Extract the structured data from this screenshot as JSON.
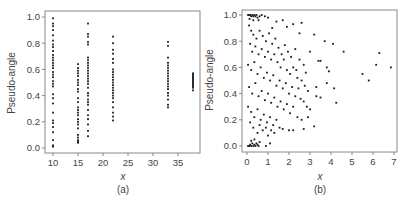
{
  "chart_data": [
    {
      "panel": "(a)",
      "type": "scatter",
      "xlabel": "x",
      "ylabel": "Pseudo-angle",
      "caption": "(a)",
      "xlim": [
        8.5,
        38.5
      ],
      "ylim": [
        -0.04,
        1.04
      ],
      "xticks": [
        10,
        15,
        20,
        25,
        30,
        35
      ],
      "yticks": [
        "0.0",
        "0.2",
        "0.4",
        "0.6",
        "0.8",
        "1.0"
      ],
      "grid": false,
      "columns": [
        {
          "x": 10,
          "y_min": 0.01,
          "y_max": 0.99
        },
        {
          "x": 15,
          "y_min": 0.04,
          "y_max": 0.64
        },
        {
          "x": 17,
          "y_min": 0.09,
          "y_max": 0.95
        },
        {
          "x": 22,
          "y_min": 0.21,
          "y_max": 0.85
        },
        {
          "x": 33,
          "y_min": 0.31,
          "y_max": 0.81
        },
        {
          "x": 38,
          "y_min": 0.44,
          "y_max": 0.57
        }
      ],
      "points": [
        [
          10,
          0.99
        ],
        [
          10,
          0.95
        ],
        [
          10,
          0.93
        ],
        [
          10,
          0.9
        ],
        [
          10,
          0.86
        ],
        [
          10,
          0.82
        ],
        [
          10,
          0.79
        ],
        [
          10,
          0.77
        ],
        [
          10,
          0.74
        ],
        [
          10,
          0.71
        ],
        [
          10,
          0.69
        ],
        [
          10,
          0.67
        ],
        [
          10,
          0.65
        ],
        [
          10,
          0.63
        ],
        [
          10,
          0.61
        ],
        [
          10,
          0.58
        ],
        [
          10,
          0.56
        ],
        [
          10,
          0.54
        ],
        [
          10,
          0.51
        ],
        [
          10,
          0.49
        ],
        [
          10,
          0.47
        ],
        [
          10,
          0.41
        ],
        [
          10,
          0.38
        ],
        [
          10,
          0.34
        ],
        [
          10,
          0.27
        ],
        [
          10,
          0.21
        ],
        [
          10,
          0.19
        ],
        [
          10,
          0.16
        ],
        [
          10,
          0.12
        ],
        [
          10,
          0.06
        ],
        [
          10,
          0.02
        ],
        [
          10,
          0.01
        ],
        [
          15,
          0.64
        ],
        [
          15,
          0.61
        ],
        [
          15,
          0.59
        ],
        [
          15,
          0.57
        ],
        [
          15,
          0.55
        ],
        [
          15,
          0.52
        ],
        [
          15,
          0.5
        ],
        [
          15,
          0.48
        ],
        [
          15,
          0.45
        ],
        [
          15,
          0.43
        ],
        [
          15,
          0.38
        ],
        [
          15,
          0.35
        ],
        [
          15,
          0.31
        ],
        [
          15,
          0.29
        ],
        [
          15,
          0.27
        ],
        [
          15,
          0.25
        ],
        [
          15,
          0.22
        ],
        [
          15,
          0.2
        ],
        [
          15,
          0.18
        ],
        [
          15,
          0.15
        ],
        [
          15,
          0.1
        ],
        [
          15,
          0.08
        ],
        [
          15,
          0.06
        ],
        [
          15,
          0.05
        ],
        [
          15,
          0.04
        ],
        [
          17,
          0.95
        ],
        [
          17,
          0.87
        ],
        [
          17,
          0.85
        ],
        [
          17,
          0.81
        ],
        [
          17,
          0.79
        ],
        [
          17,
          0.69
        ],
        [
          17,
          0.67
        ],
        [
          17,
          0.65
        ],
        [
          17,
          0.63
        ],
        [
          17,
          0.61
        ],
        [
          17,
          0.59
        ],
        [
          17,
          0.57
        ],
        [
          17,
          0.55
        ],
        [
          17,
          0.53
        ],
        [
          17,
          0.51
        ],
        [
          17,
          0.49
        ],
        [
          17,
          0.46
        ],
        [
          17,
          0.42
        ],
        [
          17,
          0.4
        ],
        [
          17,
          0.37
        ],
        [
          17,
          0.35
        ],
        [
          17,
          0.33
        ],
        [
          17,
          0.29
        ],
        [
          17,
          0.25
        ],
        [
          17,
          0.22
        ],
        [
          17,
          0.18
        ],
        [
          17,
          0.13
        ],
        [
          17,
          0.09
        ],
        [
          22,
          0.85
        ],
        [
          22,
          0.8
        ],
        [
          22,
          0.75
        ],
        [
          22,
          0.72
        ],
        [
          22,
          0.68
        ],
        [
          22,
          0.65
        ],
        [
          22,
          0.6
        ],
        [
          22,
          0.58
        ],
        [
          22,
          0.56
        ],
        [
          22,
          0.54
        ],
        [
          22,
          0.52
        ],
        [
          22,
          0.5
        ],
        [
          22,
          0.48
        ],
        [
          22,
          0.46
        ],
        [
          22,
          0.44
        ],
        [
          22,
          0.42
        ],
        [
          22,
          0.4
        ],
        [
          22,
          0.38
        ],
        [
          22,
          0.35
        ],
        [
          22,
          0.31
        ],
        [
          22,
          0.27
        ],
        [
          22,
          0.24
        ],
        [
          22,
          0.21
        ],
        [
          33,
          0.81
        ],
        [
          33,
          0.78
        ],
        [
          33,
          0.69
        ],
        [
          33,
          0.65
        ],
        [
          33,
          0.63
        ],
        [
          33,
          0.61
        ],
        [
          33,
          0.59
        ],
        [
          33,
          0.57
        ],
        [
          33,
          0.55
        ],
        [
          33,
          0.53
        ],
        [
          33,
          0.51
        ],
        [
          33,
          0.49
        ],
        [
          33,
          0.47
        ],
        [
          33,
          0.45
        ],
        [
          33,
          0.42
        ],
        [
          33,
          0.4
        ],
        [
          33,
          0.37
        ],
        [
          33,
          0.33
        ],
        [
          33,
          0.31
        ],
        [
          38,
          0.57
        ],
        [
          38,
          0.56
        ],
        [
          38,
          0.55
        ],
        [
          38,
          0.54
        ],
        [
          38,
          0.53
        ],
        [
          38,
          0.52
        ],
        [
          38,
          0.51
        ],
        [
          38,
          0.5
        ],
        [
          38,
          0.49
        ],
        [
          38,
          0.48
        ],
        [
          38,
          0.47
        ],
        [
          38,
          0.46
        ],
        [
          38,
          0.44
        ]
      ]
    },
    {
      "panel": "(b)",
      "type": "scatter",
      "xlabel": "x",
      "ylabel": "Pseudo-angle",
      "caption": "(b)",
      "xlim": [
        -0.25,
        7.15
      ],
      "ylim": [
        -0.04,
        1.04
      ],
      "xticks": [
        0,
        1,
        2,
        3,
        4,
        5,
        6,
        7
      ],
      "yticks": [
        "0.0",
        "0.2",
        "0.4",
        "0.6",
        "0.8",
        "1.0"
      ],
      "grid": false,
      "description": "Dense cloud for x in 0-2, clusters at y=1.0 and y=0.0 near x 0-0.5, sparse points extending to x≈6.8",
      "points": [
        [
          0.05,
          1.0
        ],
        [
          0.1,
          1.0
        ],
        [
          0.15,
          1.0
        ],
        [
          0.2,
          0.99
        ],
        [
          0.25,
          1.0
        ],
        [
          0.3,
          0.99
        ],
        [
          0.35,
          1.0
        ],
        [
          0.4,
          0.99
        ],
        [
          0.45,
          1.0
        ],
        [
          0.5,
          0.98
        ],
        [
          0.6,
          0.99
        ],
        [
          0.7,
          1.0
        ],
        [
          0.85,
          0.99
        ],
        [
          1.0,
          0.98
        ],
        [
          0.12,
          0.97
        ],
        [
          0.3,
          0.96
        ],
        [
          0.55,
          0.96
        ],
        [
          0.05,
          0.0
        ],
        [
          0.1,
          0.0
        ],
        [
          0.15,
          0.01
        ],
        [
          0.2,
          0.0
        ],
        [
          0.25,
          0.02
        ],
        [
          0.3,
          0.0
        ],
        [
          0.35,
          0.01
        ],
        [
          0.4,
          0.0
        ],
        [
          0.45,
          0.02
        ],
        [
          0.5,
          0.01
        ],
        [
          0.55,
          0.0
        ],
        [
          0.6,
          0.03
        ],
        [
          0.9,
          0.0
        ],
        [
          1.1,
          0.02
        ],
        [
          0.2,
          0.04
        ],
        [
          0.35,
          0.05
        ],
        [
          1.4,
          0.95
        ],
        [
          1.7,
          0.96
        ],
        [
          2.2,
          0.93
        ],
        [
          2.6,
          0.94
        ],
        [
          1.2,
          0.9
        ],
        [
          1.9,
          0.91
        ],
        [
          2.5,
          0.86
        ],
        [
          3.2,
          0.85
        ],
        [
          3.7,
          0.8
        ],
        [
          4.1,
          0.78
        ],
        [
          4.6,
          0.72
        ],
        [
          6.3,
          0.71
        ],
        [
          3.0,
          0.72
        ],
        [
          3.4,
          0.65
        ],
        [
          3.5,
          0.65
        ],
        [
          3.8,
          0.6
        ],
        [
          3.9,
          0.57
        ],
        [
          6.15,
          0.62
        ],
        [
          6.85,
          0.6
        ],
        [
          5.5,
          0.55
        ],
        [
          5.8,
          0.5
        ],
        [
          3.8,
          0.48
        ],
        [
          4.15,
          0.44
        ],
        [
          3.3,
          0.45
        ],
        [
          4.25,
          0.33
        ],
        [
          3.5,
          0.37
        ],
        [
          3.3,
          0.38
        ],
        [
          3.0,
          0.28
        ],
        [
          2.9,
          0.22
        ],
        [
          3.2,
          0.15
        ],
        [
          2.7,
          0.13
        ],
        [
          2.2,
          0.12
        ],
        [
          2.0,
          0.12
        ],
        [
          1.7,
          0.13
        ],
        [
          0.1,
          0.92
        ],
        [
          0.2,
          0.88
        ],
        [
          0.3,
          0.85
        ],
        [
          0.45,
          0.82
        ],
        [
          0.6,
          0.88
        ],
        [
          0.75,
          0.84
        ],
        [
          0.9,
          0.8
        ],
        [
          1.05,
          0.86
        ],
        [
          1.2,
          0.78
        ],
        [
          1.35,
          0.82
        ],
        [
          1.5,
          0.75
        ],
        [
          1.65,
          0.7
        ],
        [
          1.8,
          0.77
        ],
        [
          1.95,
          0.72
        ],
        [
          2.1,
          0.68
        ],
        [
          2.3,
          0.74
        ],
        [
          2.5,
          0.66
        ],
        [
          2.7,
          0.62
        ],
        [
          2.8,
          0.56
        ],
        [
          2.35,
          0.58
        ],
        [
          0.15,
          0.78
        ],
        [
          0.25,
          0.72
        ],
        [
          0.4,
          0.76
        ],
        [
          0.55,
          0.7
        ],
        [
          0.7,
          0.74
        ],
        [
          0.85,
          0.68
        ],
        [
          1.0,
          0.72
        ],
        [
          1.15,
          0.66
        ],
        [
          1.3,
          0.7
        ],
        [
          1.45,
          0.64
        ],
        [
          1.6,
          0.6
        ],
        [
          1.75,
          0.66
        ],
        [
          1.9,
          0.58
        ],
        [
          2.05,
          0.55
        ],
        [
          2.2,
          0.6
        ],
        [
          2.4,
          0.52
        ],
        [
          2.6,
          0.5
        ],
        [
          2.75,
          0.46
        ],
        [
          2.9,
          0.42
        ],
        [
          2.45,
          0.44
        ],
        [
          0.05,
          0.62
        ],
        [
          0.2,
          0.58
        ],
        [
          0.35,
          0.64
        ],
        [
          0.5,
          0.55
        ],
        [
          0.65,
          0.6
        ],
        [
          0.8,
          0.52
        ],
        [
          0.95,
          0.56
        ],
        [
          1.1,
          0.5
        ],
        [
          1.25,
          0.54
        ],
        [
          1.4,
          0.46
        ],
        [
          1.55,
          0.5
        ],
        [
          1.7,
          0.44
        ],
        [
          1.85,
          0.48
        ],
        [
          2.0,
          0.4
        ],
        [
          2.15,
          0.45
        ],
        [
          2.3,
          0.38
        ],
        [
          2.55,
          0.36
        ],
        [
          2.7,
          0.34
        ],
        [
          2.85,
          0.3
        ],
        [
          0.1,
          0.45
        ],
        [
          0.25,
          0.4
        ],
        [
          0.4,
          0.48
        ],
        [
          0.55,
          0.38
        ],
        [
          0.7,
          0.42
        ],
        [
          0.85,
          0.35
        ],
        [
          1.0,
          0.4
        ],
        [
          1.15,
          0.33
        ],
        [
          1.3,
          0.37
        ],
        [
          1.45,
          0.3
        ],
        [
          1.6,
          0.34
        ],
        [
          1.75,
          0.28
        ],
        [
          1.9,
          0.32
        ],
        [
          2.05,
          0.25
        ],
        [
          2.2,
          0.3
        ],
        [
          2.4,
          0.22
        ],
        [
          2.6,
          0.2
        ],
        [
          0.05,
          0.3
        ],
        [
          0.2,
          0.26
        ],
        [
          0.35,
          0.22
        ],
        [
          0.5,
          0.28
        ],
        [
          0.65,
          0.2
        ],
        [
          0.8,
          0.24
        ],
        [
          0.95,
          0.18
        ],
        [
          1.1,
          0.22
        ],
        [
          1.25,
          0.16
        ],
        [
          1.4,
          0.2
        ],
        [
          1.55,
          0.14
        ],
        [
          1.3,
          0.1
        ],
        [
          1.0,
          0.08
        ],
        [
          0.75,
          0.12
        ],
        [
          0.5,
          0.1
        ],
        [
          0.3,
          0.14
        ],
        [
          0.15,
          0.18
        ],
        [
          0.6,
          0.16
        ],
        [
          0.9,
          0.14
        ],
        [
          1.15,
          0.12
        ]
      ]
    }
  ],
  "panels": {
    "a": {
      "ylabel": "Pseudo-angle",
      "xlabel": "x",
      "caption": "(a)"
    },
    "b": {
      "ylabel": "Pseudo-angle",
      "xlabel": "x",
      "caption": "(b)"
    }
  },
  "style": {
    "point_color": "#1a1a1a",
    "frame_color": "#888888",
    "text_color": "#444444"
  }
}
